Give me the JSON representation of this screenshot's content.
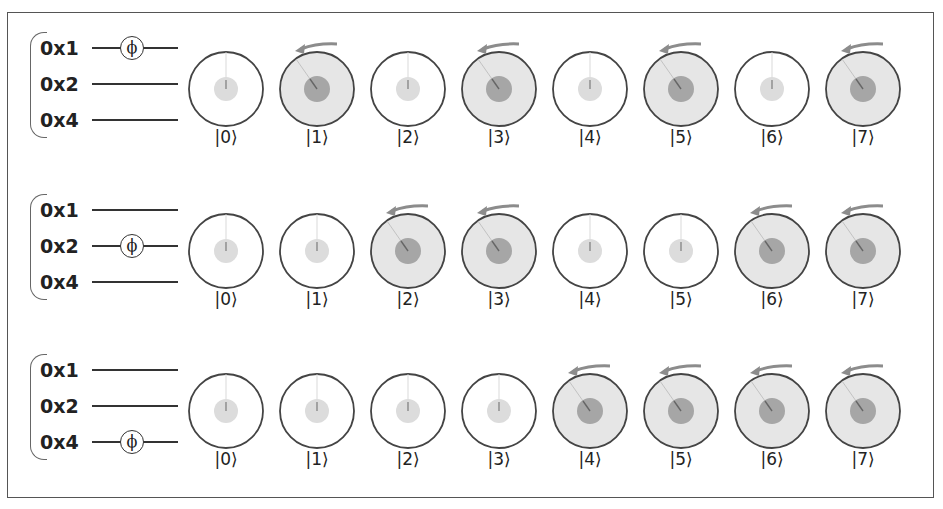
{
  "figure": {
    "qubit_labels": [
      "0x1",
      "0x2",
      "0x4"
    ],
    "gate_symbol": "ϕ",
    "colors": {
      "border": "#555555",
      "unaffected_fill": "#ffffff",
      "affected_fill": "#e6e6e6",
      "amplitude_light": "#dcdcdc",
      "amplitude_dark": "#9a9a9a",
      "arrow": "#8c8c8c"
    },
    "rows": [
      {
        "phase_on": "0x1",
        "states": [
          {
            "label": "|0⟩",
            "phased": false
          },
          {
            "label": "|1⟩",
            "phased": true
          },
          {
            "label": "|2⟩",
            "phased": false
          },
          {
            "label": "|3⟩",
            "phased": true
          },
          {
            "label": "|4⟩",
            "phased": false
          },
          {
            "label": "|5⟩",
            "phased": true
          },
          {
            "label": "|6⟩",
            "phased": false
          },
          {
            "label": "|7⟩",
            "phased": true
          }
        ]
      },
      {
        "phase_on": "0x2",
        "states": [
          {
            "label": "|0⟩",
            "phased": false
          },
          {
            "label": "|1⟩",
            "phased": false
          },
          {
            "label": "|2⟩",
            "phased": true
          },
          {
            "label": "|3⟩",
            "phased": true
          },
          {
            "label": "|4⟩",
            "phased": false
          },
          {
            "label": "|5⟩",
            "phased": false
          },
          {
            "label": "|6⟩",
            "phased": true
          },
          {
            "label": "|7⟩",
            "phased": true
          }
        ]
      },
      {
        "phase_on": "0x4",
        "states": [
          {
            "label": "|0⟩",
            "phased": false
          },
          {
            "label": "|1⟩",
            "phased": false
          },
          {
            "label": "|2⟩",
            "phased": false
          },
          {
            "label": "|3⟩",
            "phased": false
          },
          {
            "label": "|4⟩",
            "phased": true
          },
          {
            "label": "|5⟩",
            "phased": true
          },
          {
            "label": "|6⟩",
            "phased": true
          },
          {
            "label": "|7⟩",
            "phased": true
          }
        ]
      }
    ]
  }
}
